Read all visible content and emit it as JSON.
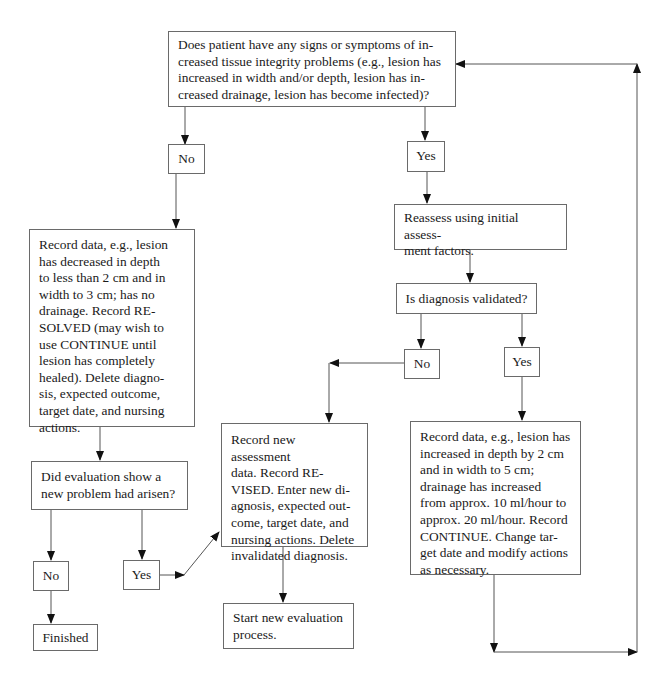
{
  "flowchart": {
    "nodes": {
      "q_tissue": "Does patient have any signs or symptoms of in-\ncreased tissue integrity problems (e.g., lesion has\nincreased in width and/or depth, lesion has in-\ncreased drainage, lesion has become infected)?",
      "q_tissue_no": "No",
      "q_tissue_yes": "Yes",
      "resolved": "Record data, e.g., lesion\nhas decreased in depth\nto less than 2 cm and in\nwidth to 3 cm; has no\ndrainage. Record RE-\nSOLVED (may wish to\nuse CONTINUE until\nlesion has completely\nhealed). Delete diagno-\nsis, expected outcome,\ntarget date, and nursing\nactions.",
      "reassess": "Reassess using initial assess-\nment factors.",
      "q_validated": "Is diagnosis validated?",
      "q_validated_no": "No",
      "q_validated_yes": "Yes",
      "q_new_problem": "Did evaluation show a\nnew problem had arisen?",
      "q_new_problem_no": "No",
      "q_new_problem_yes": "Yes",
      "finished": "Finished",
      "revised": "Record new assessment\ndata. Record RE-\nVISED. Enter new di-\nagnosis, expected out-\ncome, target date, and\nnursing actions. Delete\ninvalidated diagnosis.",
      "start_new": "Start new evaluation\nprocess.",
      "continue": "Record data, e.g., lesion has\nincreased in depth by 2 cm\nand in width to 5 cm;\ndrainage has increased\nfrom approx. 10 ml/hour to\napprox. 20 ml/hour. Record\nCONTINUE. Change tar-\nget date and modify actions\nas necessary."
    },
    "colors": {
      "line": "#4a4a4a",
      "border": "#6a6a6a",
      "text": "#1a1a1a"
    }
  }
}
